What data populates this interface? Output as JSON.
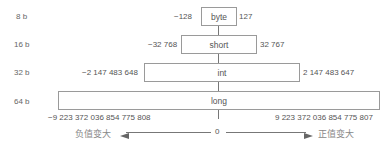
{
  "diagram": {
    "rows": [
      {
        "bits": "8 b",
        "type": "byte",
        "min": "−128",
        "max": "127"
      },
      {
        "bits": "16 b",
        "type": "short",
        "min": "−32 768",
        "max": "32 767"
      },
      {
        "bits": "32 b",
        "type": "int",
        "min": "−2 147 483 648",
        "max": "2 147 483 647"
      },
      {
        "bits": "64 b",
        "type": "long",
        "min": "−9 223 372 036 854 775 808",
        "max": "9 223 372 036 854 775 807"
      }
    ],
    "axis": {
      "zero": "0",
      "negative_label": "负值变大",
      "positive_label": "正值变大"
    }
  }
}
